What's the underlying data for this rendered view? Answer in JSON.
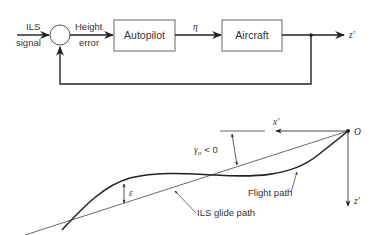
{
  "block_diagram": {
    "input_label_line1": "ILS",
    "input_label_line2": "signal",
    "error_label_line1": "Height",
    "error_label_line2": "error",
    "controller": "Autopilot",
    "control_signal": "η",
    "plant": "Aircraft",
    "output": "z'"
  },
  "geometry_diagram": {
    "origin": "O",
    "x_axis": "x'",
    "z_axis": "z'",
    "angle_label": "γₒ < 0",
    "angle_symbol": "γ",
    "angle_subscript": "o",
    "angle_relation": "< 0",
    "error_symbol": "ε",
    "flight_path_label": "Flight path",
    "glide_path_label": "ILS glide path"
  },
  "colors": {
    "line": "#222222",
    "text": "#333333",
    "background": "#ffffff"
  }
}
